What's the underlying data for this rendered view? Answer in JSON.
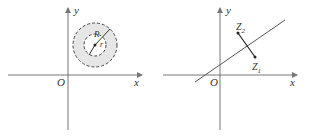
{
  "left_figure": {
    "axis_x_label": "x",
    "axis_y_label": "y",
    "origin_label": "O",
    "outer_radius_label": "R",
    "inner_radius_label": "r"
  },
  "right_figure": {
    "axis_x_label": "x",
    "axis_y_label": "y",
    "origin_label": "O",
    "point_1_label": "Z",
    "point_1_sub": "1",
    "point_2_label": "Z",
    "point_2_sub": "2"
  },
  "colors": {
    "axis": "#777777",
    "ring_fill": "#e6e6e6",
    "stroke": "#333333"
  }
}
